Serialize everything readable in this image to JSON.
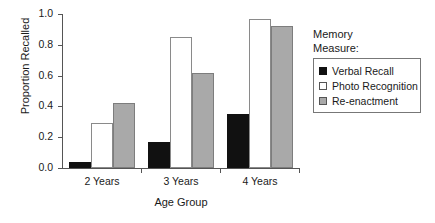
{
  "chart_data": {
    "type": "bar",
    "title": "",
    "xlabel": "Age Group",
    "ylabel": "Proportion Recalled",
    "ylim": [
      0,
      1.0
    ],
    "yticks": [
      "0.0",
      "0.2",
      "0.4",
      "0.6",
      "0.8",
      "1.0"
    ],
    "ytick_values": [
      0.0,
      0.2,
      0.4,
      0.6,
      0.8,
      1.0
    ],
    "grid": false,
    "legend_position": "right",
    "legend_title": "Memory Measure:",
    "legend_title_lines": [
      "Memory",
      "Measure:"
    ],
    "categories": [
      "2 Years",
      "3 Years",
      "4 Years"
    ],
    "series": [
      {
        "name": "Verbal Recall",
        "color": "#111111",
        "values": [
          0.04,
          0.17,
          0.35
        ]
      },
      {
        "name": "Photo Recognition",
        "color": "#ffffff",
        "values": [
          0.29,
          0.85,
          0.97
        ]
      },
      {
        "name": "Re-enactment",
        "color": "#a9a9a9",
        "values": [
          0.42,
          0.62,
          0.92
        ]
      }
    ]
  }
}
